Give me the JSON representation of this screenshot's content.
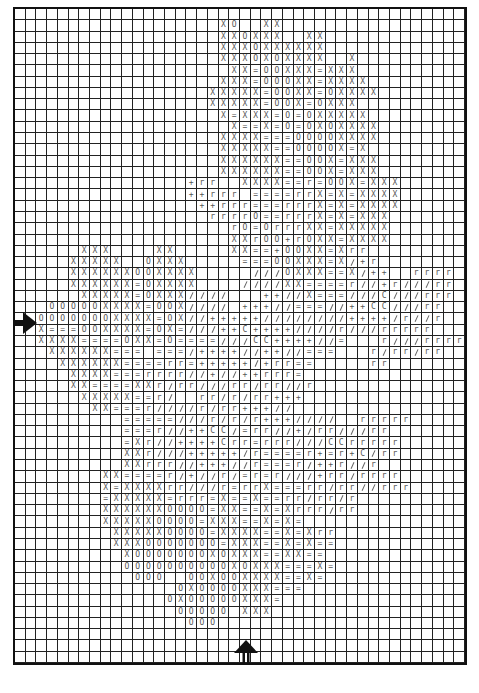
{
  "chart": {
    "title": "",
    "columns": 42,
    "rows": 58,
    "legend_symbols": {
      "x": "X",
      "o": "O",
      "=": "=",
      "r": "r",
      "+": "+",
      "c": "C",
      "/": "slash"
    },
    "markers": {
      "center_row_arrow": "right-arrow at left edge",
      "center_column_arrow": "up-arrow at bottom edge"
    },
    "grid": [
      "..........................................",
      "...................xo..xx.................",
      "...................xxoxxx..xx.............",
      "...................xxxoxxxxxx.............",
      "...................xxxoxoxxxx..x..........",
      "....................xx=ooxxx=xxx..........",
      "...................xxx=oooxx=xxxx.........",
      "..................xxxxx=ooxx=oxxxx........",
      "..................xxxxx=oox=oxxx..........",
      "...................x=xxx=o=oxxxxx.........",
      "....................x==x=o=oxoxxxx........",
      "...................xxxx===ooooxxxx........",
      "...................xxxxx==oooox=x.........",
      "...................xxxxxx==oox=xxx........",
      "...................xxxxxx==oox=xxx........",
      "................+rr..xxxx==r=oox=xxx......",
      "................++rrr.====rrx=x=xxxx......",
      ".................++rrr===rrrx=x=xxxx......",
      "..................rrrro==rrrx=x=xxx.......",
      "....................ro=orrrxx=xxxxx.......",
      "....................xxroo+roxx=xxxx.......",
      "......xxx....xx.....xx==+ooxx=xrr.........",
      ".....xxxxx..oxxx.....===ooxxx=x/+r........",
      ".....xxxxxxooxxxx.....///oxxx==x/++..rrrr.",
      ".....xxxxxx=oxxxx....////xx====r//+r///rr.",
      "......xxxxx=oxxx////...++//x===///c///rrr.",
      "...oooooxxxx=oox////.+++//===//++cc///rr..",
      "..oooooooxxxx=ox//+++++////////++++/r//r..",
      "..x===ooxxxx=ox=///++c++++////r///rrrrr...",
      "..xxxx====oxx=o====///cc++++//=...r///rrrr",
      "...xxxxxx===.===/++++//++//===...r/rr/rr..",
      "....xxxxxx====rr=+++++/+rr==.....rr.......",
      ".....xxxx===rrrr//+//++rrr=...............",
      ".....xx====xxr/rr///rr/rr//r..............",
      "......xxxxx==r/..rr/r/rr+++...............",
      ".......xx===r////r/rr+++//................",
      "..........=====///r/r/r+++////..rrrrr.....",
      "..........===r//++cc/=rr//+/rr///rr.......",
      "..........=xr//++++crr=rrr///ccrrrrr......",
      "..........xxr///+++++/r====r+=r+c/rr......",
      "..........xxrrr//+++//r===r/++r//r........",
      "........xx====r/+//r/=r=r///+rr/rrrr......",
      "........x=xxxxrr///r=rrx===rr/rr//rrr.....",
      "........=xxxxx=rrr=x==x==rr/rr/r..........",
      "........xxxxxxoooo=xx==x=xrrr/rr..........",
      "........xxxxxoooo=xxx==x=x=...............",
      ".........xxxxxoooo=xxxx==x=xrr............",
      ".........xxxooooooo=xxx==x=x==............",
      "..........xoooooooxoxxx==xx==.............",
      "..........ooooooooooxoxxx===x=............",
      "...........ooo..ooxooxxxx==x=.............",
      "...............oxooooxxx===...............",
      "..............oxoooooxxx=.................",
      "...............ooooo.xxx..................",
      "................ooo.......................",
      "..........................................",
      "..........................................",
      ".........................................."
    ]
  }
}
